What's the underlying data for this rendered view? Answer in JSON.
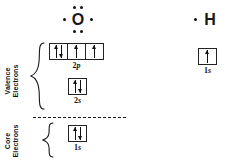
{
  "diagram": {
    "title": "Oxygen and hydrogen Lewis dot structures with orbital filling diagrams",
    "ink_color": "#1a1a1a",
    "background_color": "#ffffff"
  },
  "lewis_structures": [
    {
      "id": "oxygen",
      "symbol": "O",
      "dot_count": 6,
      "dot_positions": [
        "top-left",
        "top-right",
        "bottom-left",
        "bottom-right",
        "left",
        "right"
      ]
    },
    {
      "id": "hydrogen",
      "symbol": "H",
      "dot_count": 1,
      "dot_positions": [
        "left"
      ]
    }
  ],
  "shell_labels": {
    "valence": {
      "line1": "Valence",
      "line2": "Electrons"
    },
    "core": {
      "line1": "Core",
      "line2": "Electrons"
    }
  },
  "orbitals": [
    {
      "id": "o-2p",
      "label_n": "2",
      "label_l": "p",
      "label": "2p",
      "atom": "O",
      "shell": "valence",
      "boxes": [
        {
          "electrons": [
            "up",
            "down"
          ]
        },
        {
          "electrons": [
            "up"
          ]
        },
        {
          "electrons": [
            "up"
          ]
        }
      ]
    },
    {
      "id": "o-2s",
      "label_n": "2",
      "label_l": "s",
      "label": "2s",
      "atom": "O",
      "shell": "valence",
      "boxes": [
        {
          "electrons": [
            "up",
            "down"
          ]
        }
      ]
    },
    {
      "id": "o-1s",
      "label_n": "1",
      "label_l": "s",
      "label": "1s",
      "atom": "O",
      "shell": "core",
      "boxes": [
        {
          "electrons": [
            "up",
            "down"
          ]
        }
      ]
    },
    {
      "id": "h-1s",
      "label_n": "1",
      "label_l": "s",
      "label": "1s",
      "atom": "H",
      "shell": "valence",
      "boxes": [
        {
          "electrons": [
            "up"
          ]
        }
      ]
    }
  ]
}
